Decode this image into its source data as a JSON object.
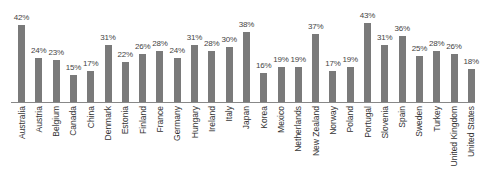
{
  "chart_data": {
    "type": "bar",
    "title": "",
    "xlabel": "",
    "ylabel": "",
    "ylim": [
      0,
      45
    ],
    "grid": false,
    "legend": null,
    "value_format": "{v}%",
    "bar_color": "#7a7a7a",
    "categories": [
      "Australia",
      "Austria",
      "Belgium",
      "Canada",
      "China",
      "Denmark",
      "Estonia",
      "Finland",
      "France",
      "Germany",
      "Hungary",
      "Ireland",
      "Italy",
      "Japan",
      "Korea",
      "Mexico",
      "Netherlands",
      "New Zealand",
      "Norway",
      "Poland",
      "Portugal",
      "Slovenia",
      "Spain",
      "Sweden",
      "Turkey",
      "United Kingdom",
      "United States"
    ],
    "values": [
      42,
      24,
      23,
      15,
      17,
      31,
      22,
      26,
      28,
      24,
      31,
      28,
      30,
      38,
      16,
      19,
      19,
      37,
      17,
      19,
      43,
      31,
      36,
      25,
      28,
      26,
      18
    ],
    "labels": [
      "42%",
      "24%",
      "23%",
      "15%",
      "17%",
      "31%",
      "22%",
      "26%",
      "28%",
      "24%",
      "31%",
      "28%",
      "30%",
      "38%",
      "16%",
      "19%",
      "19%",
      "37%",
      "17%",
      "19%",
      "43%",
      "31%",
      "36%",
      "25%",
      "28%",
      "26%",
      "18%"
    ]
  }
}
